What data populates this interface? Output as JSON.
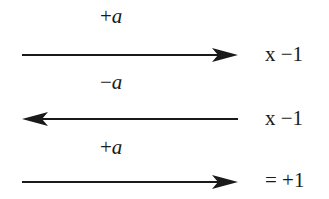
{
  "diagram": {
    "rows": [
      {
        "label_sign": "+",
        "label_var": "a",
        "direction": "right",
        "result": "x −1"
      },
      {
        "label_sign": "−",
        "label_var": "a",
        "direction": "left",
        "result": "x −1"
      },
      {
        "label_sign": "+",
        "label_var": "a",
        "direction": "right",
        "result": "= +1"
      }
    ],
    "colors": {
      "ink": "#1a1a1a",
      "background": "#ffffff"
    }
  }
}
